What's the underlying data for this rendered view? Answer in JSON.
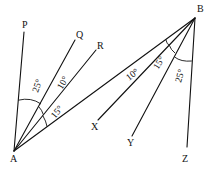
{
  "diagram": {
    "points": {
      "A": {
        "label": "A"
      },
      "B": {
        "label": "B"
      },
      "P": {
        "label": "P"
      },
      "Q": {
        "label": "Q"
      },
      "R": {
        "label": "R"
      },
      "X": {
        "label": "X"
      },
      "Y": {
        "label": "Y"
      },
      "Z": {
        "label": "Z"
      }
    },
    "angles": {
      "PAQ": "25°",
      "QAR": "10°",
      "RAB": "15°",
      "ABX": "10°",
      "XBY": "15°",
      "YBZ": "25°"
    },
    "colors": {
      "stroke": "#111111",
      "background": "#ffffff"
    }
  }
}
